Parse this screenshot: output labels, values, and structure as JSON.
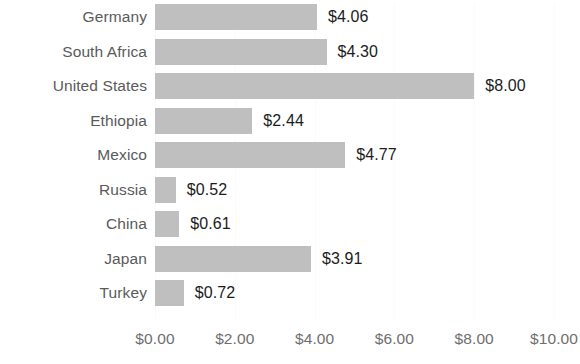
{
  "chart_data": {
    "type": "bar",
    "orientation": "horizontal",
    "title": "",
    "subtitle": "",
    "xlabel": "",
    "ylabel": "",
    "categories": [
      "Germany",
      "South Africa",
      "United States",
      "Ethiopia",
      "Mexico",
      "Russia",
      "China",
      "Japan",
      "Turkey"
    ],
    "values": [
      4.06,
      4.3,
      8.0,
      2.44,
      4.77,
      0.52,
      0.61,
      3.91,
      0.72
    ],
    "data_labels": [
      "$4.06",
      "$4.30",
      "$8.00",
      "$2.44",
      "$4.77",
      "$0.52",
      "$0.61",
      "$3.91",
      "$0.72"
    ],
    "xlim": [
      0,
      10
    ],
    "xticks": [
      0,
      2,
      4,
      6,
      8,
      10
    ],
    "xtick_labels": [
      "$0.00",
      "$2.00",
      "$4.00",
      "$6.00",
      "$8.00",
      "$10.00"
    ],
    "grid": true,
    "legend": null,
    "bar_color": "#bfbfbf",
    "category_label_color": "#5a5a5a",
    "data_label_color": "#1c1c1c",
    "tick_label_color": "#6e6e6e",
    "background_color": "#ffffff"
  }
}
